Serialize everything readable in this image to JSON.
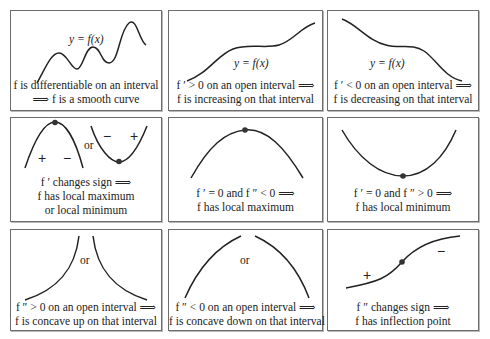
{
  "panels": [
    {
      "id": "smooth",
      "function_label": "y = f(x)",
      "caption": [
        "f is differentiable on an interval",
        "⟹ f is a smooth curve"
      ]
    },
    {
      "id": "increasing",
      "function_label": "y = f(x)",
      "caption": [
        "f ′ > 0 on an open interval ⟹",
        "f is increasing on that interval"
      ]
    },
    {
      "id": "decreasing",
      "function_label": "y = f(x)",
      "caption": [
        "f ′ < 0 on an open interval ⟹",
        "f is decreasing on that interval"
      ]
    },
    {
      "id": "sign-change",
      "or_label": "or",
      "signs": [
        "+",
        "−",
        "−",
        "+"
      ],
      "caption": [
        "f ′ changes sign ⟹",
        "f has local maximum",
        "or local minimum"
      ]
    },
    {
      "id": "local-max",
      "caption": [
        "f ′ = 0 and f ″ < 0 ⟹",
        "f has local maximum"
      ]
    },
    {
      "id": "local-min",
      "caption": [
        "f ′ = 0 and f ″ > 0 ⟹",
        "f has local minimum"
      ]
    },
    {
      "id": "concave-up",
      "or_label": "or",
      "caption": [
        "f ″ > 0 on an open interval ⟹",
        "f is concave up on that interval"
      ]
    },
    {
      "id": "concave-down",
      "or_label": "or",
      "caption": [
        "f ″ < 0 on an open interval ⟹",
        "f is concave down on that interval"
      ]
    },
    {
      "id": "inflection",
      "signs": [
        "+",
        "−"
      ],
      "caption": [
        "f ″ changes sign ⟹",
        "f has inflection point"
      ]
    }
  ]
}
